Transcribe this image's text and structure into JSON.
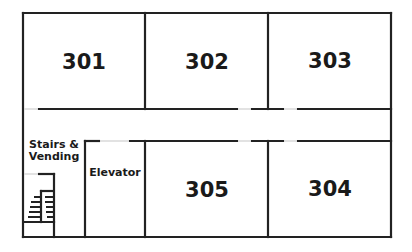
{
  "floor_plan": {
    "rooms": [
      {
        "id": "301",
        "label": "301"
      },
      {
        "id": "302",
        "label": "302"
      },
      {
        "id": "303",
        "label": "303"
      },
      {
        "id": "305",
        "label": "305"
      },
      {
        "id": "304",
        "label": "304"
      }
    ],
    "areas": {
      "stairs": "Stairs &",
      "stairs_line2": "Vending",
      "elevator": "Elevator"
    },
    "colors": {
      "wall": "#222222",
      "door": "#d8d8d8",
      "background": "#ffffff"
    }
  }
}
